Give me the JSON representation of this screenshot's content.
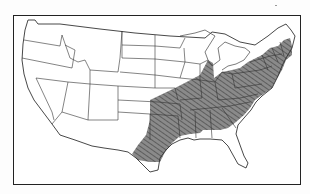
{
  "map": {
    "title": "",
    "region": "contiguous United States",
    "shaded_range": "eastern United States (hatched distribution area)",
    "colors": {
      "border": "#222222",
      "state_lines": "#333333",
      "shade": "#7a7a7a",
      "hatch": "#4a4a4a",
      "background": "#ffffff"
    },
    "legend": []
  }
}
